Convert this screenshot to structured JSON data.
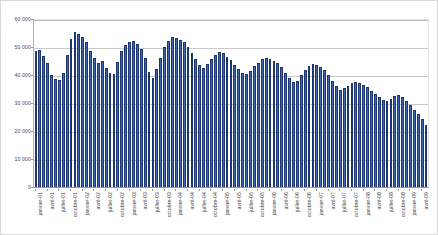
{
  "chart_data": {
    "type": "bar",
    "title": "",
    "subtitle": "",
    "xlabel": "",
    "ylabel": "",
    "ylim": [
      0,
      60000
    ],
    "ytick_values": [
      0,
      10000,
      20000,
      30000,
      40000,
      50000,
      60000
    ],
    "ytick_labels": [
      "0",
      "10 000",
      "20 000",
      "30 000",
      "40 000",
      "50 000",
      "60 000"
    ],
    "grid": true,
    "legend": "none",
    "series_color": "#3f67ae",
    "bar_edge_color": "#1d3570",
    "categories": [
      "janvier-01",
      "février-01",
      "mars-01",
      "avril-01",
      "mai-01",
      "juin-01",
      "juillet-01",
      "août-01",
      "septembre-01",
      "octobre-01",
      "novembre-01",
      "décembre-01",
      "janvier-02",
      "février-02",
      "mars-02",
      "avril-02",
      "mai-02",
      "juin-02",
      "juillet-02",
      "août-02",
      "septembre-02",
      "octobre-02",
      "novembre-02",
      "décembre-02",
      "janvier-03",
      "février-03",
      "mars-03",
      "avril-03",
      "mai-03",
      "juin-03",
      "juillet-03",
      "août-03",
      "septembre-03",
      "octobre-03",
      "novembre-03",
      "décembre-03",
      "janvier-04",
      "février-04",
      "mars-04",
      "avril-04",
      "mai-04",
      "juin-04",
      "juillet-04",
      "août-04",
      "septembre-04",
      "octobre-04",
      "novembre-04",
      "décembre-04",
      "janvier-05",
      "février-05",
      "mars-05",
      "avril-05",
      "mai-05",
      "juin-05",
      "juillet-05",
      "août-05",
      "septembre-05",
      "octobre-05",
      "novembre-05",
      "décembre-05",
      "janvier-06",
      "février-06",
      "mars-06",
      "avril-06",
      "mai-06",
      "juin-06",
      "juillet-06",
      "août-06",
      "septembre-06",
      "octobre-06",
      "novembre-06",
      "décembre-06",
      "janvier-07",
      "février-07",
      "mars-07",
      "avril-07",
      "mai-07",
      "juin-07",
      "juillet-07",
      "août-07",
      "septembre-07",
      "octobre-07",
      "novembre-07",
      "décembre-07",
      "janvier-08",
      "février-08",
      "mars-08",
      "avril-08",
      "mai-08",
      "juin-08",
      "juillet-08",
      "août-08",
      "septembre-08",
      "octobre-08",
      "novembre-08",
      "décembre-08",
      "janvier-09",
      "février-09",
      "mars-09",
      "avril-09",
      "mai-09"
    ],
    "values": [
      48800,
      49400,
      47000,
      44800,
      40500,
      38800,
      38500,
      41000,
      47600,
      53200,
      55800,
      55000,
      53800,
      52000,
      49000,
      46300,
      44700,
      45500,
      42700,
      41200,
      40800,
      44900,
      48900,
      51200,
      52200,
      52600,
      51500,
      49700,
      46600,
      41600,
      39400,
      42600,
      46600,
      50200,
      52500,
      53800,
      53500,
      52700,
      52000,
      50300,
      48200,
      46200,
      44000,
      43000,
      44400,
      46200,
      47600,
      48600,
      48200,
      46900,
      45800,
      44100,
      42400,
      41200,
      40600,
      41900,
      43500,
      44600,
      45900,
      46400,
      46000,
      45400,
      44500,
      43200,
      41100,
      39200,
      37900,
      38300,
      40200,
      42000,
      43500,
      44400,
      44100,
      43300,
      42200,
      40300,
      38200,
      36600,
      35100,
      35700,
      36600,
      37600,
      37900,
      37600,
      36800,
      36000,
      34800,
      33700,
      32600,
      31600,
      31000,
      31800,
      32900,
      33200,
      32400,
      31000,
      29500,
      28000,
      26400,
      24600,
      22600
    ],
    "xtick_labels": [
      "janvier-01",
      "avril-01",
      "juillet-01",
      "octobre-01",
      "janvier-02",
      "avril-02",
      "juillet-02",
      "octobre-02",
      "janvier-03",
      "avril-03",
      "juillet-03",
      "octobre-03",
      "janvier-04",
      "avril-04",
      "juillet-04",
      "octobre-04",
      "janvier-05",
      "avril-05",
      "juillet-05",
      "octobre-05",
      "janvier-06",
      "avril-06",
      "juillet-06",
      "octobre-06",
      "janvier-07",
      "avril-07",
      "juillet-07",
      "octobre-07",
      "janvier-08",
      "avril-08",
      "juillet-08",
      "octobre-08",
      "janvier-09",
      "avril-09"
    ],
    "xtick_interval_months": 3
  }
}
